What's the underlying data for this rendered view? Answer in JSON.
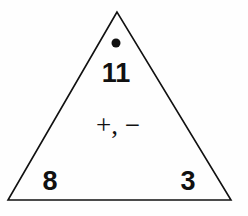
{
  "diagram": {
    "type": "fact-family-triangle",
    "top_number": "11",
    "bottom_left_number": "8",
    "bottom_right_number": "3",
    "operations": "+, −",
    "marker": "dot"
  }
}
